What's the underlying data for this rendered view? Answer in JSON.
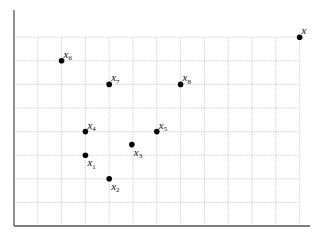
{
  "chart_data": {
    "type": "scatter",
    "title": "",
    "xlabel": "",
    "ylabel": "",
    "grid": true,
    "grid_style": "dotted",
    "axis_color": "#555555",
    "grid_color": "#bbbbbb",
    "point_color": "#000000",
    "xlim": [
      0,
      12.5
    ],
    "ylim": [
      0,
      8.5
    ],
    "points": [
      {
        "name": "x",
        "label_main": "x",
        "label_sub": "",
        "x": 12,
        "y": 8,
        "label_pos": "above-right"
      },
      {
        "name": "x1",
        "label_main": "x",
        "label_sub": "1",
        "x": 3,
        "y": 3,
        "label_pos": "below-right"
      },
      {
        "name": "x2",
        "label_main": "x",
        "label_sub": "2",
        "x": 4,
        "y": 2,
        "label_pos": "below-right"
      },
      {
        "name": "x3",
        "label_main": "x",
        "label_sub": "3",
        "x": 4.95,
        "y": 3.45,
        "label_pos": "below-right"
      },
      {
        "name": "x4",
        "label_main": "x",
        "label_sub": "4",
        "x": 3,
        "y": 4,
        "label_pos": "above-right"
      },
      {
        "name": "x5",
        "label_main": "x",
        "label_sub": "5",
        "x": 6,
        "y": 4,
        "label_pos": "above-right"
      },
      {
        "name": "x6",
        "label_main": "x",
        "label_sub": "6",
        "x": 2,
        "y": 7,
        "label_pos": "above-right"
      },
      {
        "name": "x7",
        "label_main": "x",
        "label_sub": "7",
        "x": 4,
        "y": 6,
        "label_pos": "above-right"
      },
      {
        "name": "x8",
        "label_main": "x",
        "label_sub": "8",
        "x": 7,
        "y": 6,
        "label_pos": "above-right"
      }
    ]
  }
}
